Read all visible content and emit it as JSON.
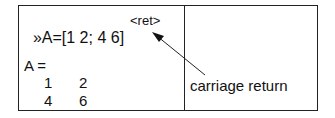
{
  "command": {
    "prompt": "»",
    "text": "A=[1 2; 4 6]",
    "key": "<ret>"
  },
  "output": {
    "label": "A =",
    "matrix": [
      [
        "1",
        "2"
      ],
      [
        "4",
        "6"
      ]
    ]
  },
  "annotation": {
    "text": "carriage return"
  }
}
